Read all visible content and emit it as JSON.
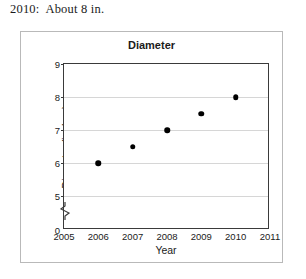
{
  "header": {
    "answer_text": "2010:  About 8 in."
  },
  "chart_data": {
    "type": "scatter",
    "title": "Diameter",
    "xlabel": "Year",
    "ylabel": "Diameter (inches)",
    "x": [
      2006,
      2007,
      2008,
      2009,
      2010
    ],
    "values": [
      6,
      6.5,
      7,
      7.5,
      8
    ],
    "points": [
      {
        "x": 2006,
        "y": 6
      },
      {
        "x": 2007,
        "y": 6.5
      },
      {
        "x": 2008,
        "y": 7
      },
      {
        "x": 2009,
        "y": 7.5
      },
      {
        "x": 2010,
        "y": 8
      }
    ],
    "xlim": [
      2005,
      2011
    ],
    "ylim": [
      5,
      9
    ],
    "x_ticks": [
      2005,
      2006,
      2007,
      2008,
      2009,
      2010,
      2011
    ],
    "x_tick_labels": [
      "2005",
      "2006",
      "2007",
      "2008",
      "2009",
      "2010",
      "2011"
    ],
    "y_ticks": [
      5,
      6,
      7,
      8,
      9
    ],
    "y_tick_labels": [
      "5",
      "6",
      "7",
      "8",
      "9"
    ],
    "y_origin_label": "0",
    "y_axis_break": true,
    "grid": "horizontal",
    "legend": "none",
    "marker_color": "#000000",
    "gridline_color": "#d6d6d6",
    "frame_color": "#3a3a3a"
  }
}
